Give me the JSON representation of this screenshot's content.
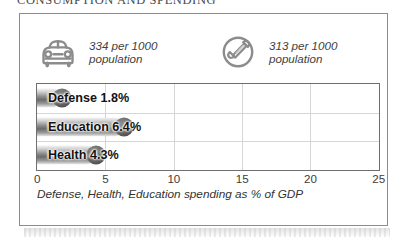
{
  "section": {
    "heading": "CONSUMPTION AND SPENDING"
  },
  "stats": [
    {
      "icon": "car-icon",
      "name": "vehicles",
      "value": "334 per 1000\npopulation"
    },
    {
      "icon": "telephone-icon",
      "name": "telephones",
      "value": "313 per 1000\npopulation"
    }
  ],
  "chart_data": {
    "type": "bar",
    "orientation": "horizontal",
    "title": "",
    "caption": "Defense, Health, Education spending as % of GDP",
    "categories": [
      "Defense",
      "Education",
      "Health"
    ],
    "values": [
      1.8,
      6.4,
      4.3
    ],
    "value_labels": [
      "1.8%",
      "6.4%",
      "4.3%"
    ],
    "bar_labels": [
      "Defense 1.8%",
      "Education 6.4%",
      "Health 4.3%"
    ],
    "xlabel": "",
    "ylabel": "",
    "xlim": [
      0,
      25
    ],
    "xticks": [
      0,
      5,
      10,
      15,
      20,
      25
    ],
    "xtick_labels": [
      "0",
      "5",
      "10",
      "15",
      "20",
      "25"
    ],
    "grid": true,
    "legend": false
  },
  "colors": {
    "card_border": "#8d8d8d",
    "plot_border": "#6f6f6f",
    "gridline": "#d6d6d6",
    "bar_dark": "#6b6b6b",
    "bar_light": "#efefef",
    "text": "#333333",
    "background": "#ffffff"
  }
}
